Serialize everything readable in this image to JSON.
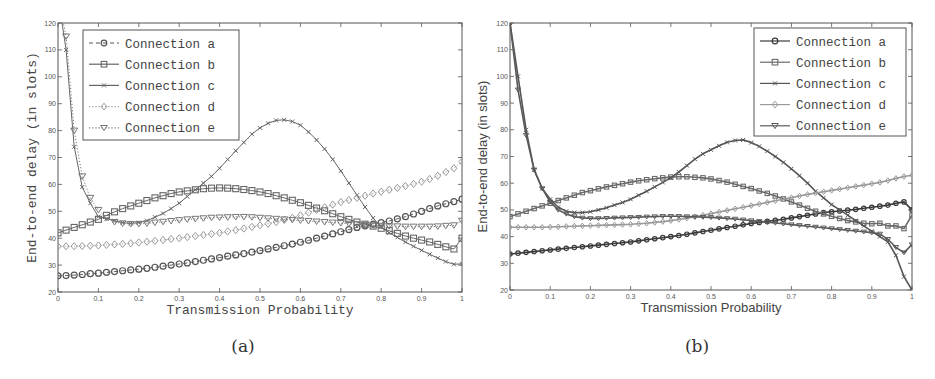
{
  "chart_data": [
    {
      "id": "a",
      "type": "line",
      "caption": "(a)",
      "xlabel": "Transmission Probability",
      "ylabel": "End-to-end delay (in slots)",
      "xlim": [
        0,
        1
      ],
      "ylim": [
        20,
        120
      ],
      "xticks": [
        "0",
        "0.1",
        "0.2",
        "0.3",
        "0.4",
        "0.5",
        "0.6",
        "0.7",
        "0.8",
        "0.9",
        "1"
      ],
      "yticks": [
        "20",
        "30",
        "40",
        "50",
        "60",
        "70",
        "80",
        "90",
        "100",
        "110",
        "120"
      ],
      "grid": false,
      "legend_position": "top-left",
      "x": [
        0,
        0.02,
        0.04,
        0.06,
        0.08,
        0.1,
        0.12,
        0.14,
        0.16,
        0.18,
        0.2,
        0.22,
        0.24,
        0.26,
        0.28,
        0.3,
        0.32,
        0.34,
        0.36,
        0.38,
        0.4,
        0.42,
        0.44,
        0.46,
        0.48,
        0.5,
        0.52,
        0.54,
        0.56,
        0.58,
        0.6,
        0.62,
        0.64,
        0.66,
        0.68,
        0.7,
        0.72,
        0.74,
        0.76,
        0.78,
        0.8,
        0.82,
        0.84,
        0.86,
        0.88,
        0.9,
        0.92,
        0.94,
        0.96,
        0.98,
        1.0
      ],
      "series": [
        {
          "name": "Connection a",
          "marker": "circle",
          "line": "dashed",
          "color": "#555555",
          "values": [
            26,
            26.1,
            26.3,
            26.5,
            26.8,
            27,
            27.3,
            27.6,
            27.9,
            28.2,
            28.5,
            28.8,
            29.2,
            29.6,
            30,
            30.4,
            30.8,
            31.3,
            31.8,
            32.3,
            32.8,
            33.3,
            33.8,
            34.3,
            34.8,
            35.4,
            36,
            36.6,
            37.2,
            37.8,
            38.5,
            39.2,
            40,
            40.8,
            41.6,
            42.4,
            43.2,
            44,
            44.6,
            45.2,
            45.8,
            46.4,
            47.2,
            48,
            49,
            50,
            51,
            52,
            52.8,
            53.6,
            54.5
          ]
        },
        {
          "name": "Connection b",
          "marker": "square",
          "line": "solid",
          "color": "#666666",
          "values": [
            42,
            43,
            44,
            45,
            46,
            47,
            48.5,
            49.8,
            51,
            52,
            53,
            54,
            55,
            55.8,
            56.6,
            57.2,
            57.6,
            58,
            58.4,
            58.6,
            58.7,
            58.6,
            58.4,
            58.1,
            57.7,
            57.2,
            56.6,
            55.8,
            55,
            54.1,
            53.2,
            52.2,
            51.2,
            50.2,
            49.1,
            48,
            47,
            46,
            45.2,
            44.5,
            43.7,
            42.8,
            41.8,
            40.8,
            40,
            39.3,
            38.6,
            37.7,
            36.8,
            36,
            40
          ]
        },
        {
          "name": "Connection c",
          "marker": "x",
          "line": "solid",
          "color": "#666666",
          "values": [
            130,
            110,
            74,
            59,
            53,
            48,
            47.2,
            46.5,
            45.8,
            45.5,
            45.8,
            46.5,
            47.8,
            49.2,
            51,
            53,
            55.5,
            58,
            60.5,
            63,
            66,
            69.3,
            72.5,
            75.6,
            78.7,
            81,
            82.7,
            83.8,
            84,
            83.4,
            82,
            79.5,
            76.5,
            73.2,
            69.3,
            65,
            60.5,
            56,
            51.6,
            47.5,
            44.2,
            42,
            40.3,
            38.6,
            37,
            35.5,
            34,
            32.6,
            31.3,
            30.3,
            30.5
          ]
        },
        {
          "name": "Connection d",
          "marker": "diamond",
          "line": "dotted",
          "color": "#999999",
          "values": [
            37,
            37,
            37,
            37.1,
            37.2,
            37.3,
            37.5,
            37.7,
            37.9,
            38.1,
            38.4,
            38.7,
            39,
            39.3,
            39.7,
            40,
            40.4,
            40.8,
            41.2,
            41.6,
            42,
            42.5,
            43,
            43.6,
            44.2,
            44.8,
            45.4,
            46,
            46.8,
            47.6,
            48.5,
            49.5,
            50.5,
            51.5,
            52.5,
            53.4,
            54.2,
            55,
            55.8,
            56.6,
            57.3,
            58,
            58.7,
            59.4,
            60.2,
            61,
            62,
            63.2,
            64.6,
            66,
            68.5
          ]
        },
        {
          "name": "Connection e",
          "marker": "triangle-down",
          "line": "dotted",
          "color": "#777777",
          "values": [
            130,
            115,
            80,
            63,
            55,
            50.5,
            47.5,
            46,
            45.5,
            45.3,
            45.3,
            45.5,
            45.8,
            46.1,
            46.4,
            46.7,
            47,
            47.2,
            47.4,
            47.6,
            47.7,
            47.8,
            47.9,
            47.9,
            47.8,
            47.6,
            47.4,
            47.2,
            47,
            46.8,
            46.6,
            46.4,
            46.2,
            46,
            45.8,
            45.6,
            45.4,
            45.2,
            45,
            44.8,
            44.6,
            44.5,
            44.4,
            44.3,
            44.3,
            44.3,
            44.3,
            44.4,
            44.6,
            44.8,
            46.5
          ]
        }
      ]
    },
    {
      "id": "b",
      "type": "line",
      "caption": "(b)",
      "xlabel": "Transmission Probability",
      "ylabel": "End-to-end delay (in slots)",
      "xlim": [
        0,
        1
      ],
      "ylim": [
        20,
        120
      ],
      "xticks": [
        "0",
        "0.1",
        "0.2",
        "0.3",
        "0.4",
        "0.5",
        "0.6",
        "0.7",
        "0.8",
        "0.9",
        "1"
      ],
      "yticks": [
        "20",
        "30",
        "40",
        "50",
        "60",
        "70",
        "80",
        "90",
        "100",
        "110",
        "120"
      ],
      "grid": false,
      "legend_position": "top-right",
      "x": [
        0,
        0.02,
        0.04,
        0.06,
        0.08,
        0.1,
        0.12,
        0.14,
        0.16,
        0.18,
        0.2,
        0.22,
        0.24,
        0.26,
        0.28,
        0.3,
        0.32,
        0.34,
        0.36,
        0.38,
        0.4,
        0.42,
        0.44,
        0.46,
        0.48,
        0.5,
        0.52,
        0.54,
        0.56,
        0.58,
        0.6,
        0.62,
        0.64,
        0.66,
        0.68,
        0.7,
        0.72,
        0.74,
        0.76,
        0.78,
        0.8,
        0.82,
        0.84,
        0.86,
        0.88,
        0.9,
        0.92,
        0.94,
        0.96,
        0.98,
        1.0
      ],
      "series": [
        {
          "name": "Connection a",
          "marker": "circle",
          "line": "solid",
          "color": "#3a3a3a",
          "values": [
            33.5,
            33.8,
            34.1,
            34.4,
            34.7,
            35,
            35.3,
            35.6,
            35.9,
            36.2,
            36.5,
            36.8,
            37.1,
            37.4,
            37.7,
            38,
            38.4,
            38.8,
            39.2,
            39.6,
            40,
            40.4,
            40.9,
            41.4,
            41.9,
            42.4,
            42.9,
            43.4,
            43.9,
            44.4,
            44.9,
            45.3,
            45.7,
            46.1,
            46.5,
            47,
            47.5,
            48,
            48.5,
            49,
            49.3,
            49.6,
            49.9,
            50.2,
            50.6,
            51,
            51.4,
            51.8,
            52.5,
            53,
            50
          ]
        },
        {
          "name": "Connection b",
          "marker": "square",
          "line": "solid",
          "color": "#6a6a6a",
          "values": [
            47.5,
            48.5,
            49.5,
            50.5,
            51.5,
            52.5,
            53.5,
            54.5,
            55.5,
            56.5,
            57.2,
            57.9,
            58.6,
            59.2,
            59.8,
            60.4,
            60.9,
            61.3,
            61.7,
            62,
            62.3,
            62.4,
            62.4,
            62.2,
            62,
            61.6,
            61,
            60.4,
            59.6,
            58.8,
            58,
            57.1,
            56.2,
            55.2,
            54.1,
            53,
            51.8,
            50.6,
            49.5,
            48.5,
            47.6,
            46.8,
            46,
            45.5,
            45,
            44.8,
            45,
            44,
            44,
            43,
            48
          ]
        },
        {
          "name": "Connection c",
          "marker": "x",
          "line": "solid",
          "color": "#555555",
          "values": [
            120,
            100,
            80,
            65,
            58,
            54,
            51,
            49.5,
            49,
            49,
            49.3,
            50,
            50.8,
            51.8,
            52.8,
            54,
            55.5,
            57,
            58.6,
            60.3,
            62,
            64.2,
            66.6,
            69,
            71,
            72.5,
            74,
            75.3,
            76,
            76.2,
            75.2,
            73.8,
            72,
            70,
            67.8,
            65.4,
            62.8,
            60,
            57,
            54.5,
            52,
            50,
            48,
            46,
            44,
            42,
            40,
            38,
            33,
            25,
            20
          ]
        },
        {
          "name": "Connection d",
          "marker": "diamond",
          "line": "solid",
          "color": "#9a9a9a",
          "values": [
            43.5,
            43.5,
            43.5,
            43.5,
            43.5,
            43.6,
            43.7,
            43.8,
            43.9,
            44,
            44.1,
            44.2,
            44.3,
            44.4,
            44.5,
            44.6,
            44.8,
            45,
            45.3,
            45.6,
            46,
            46.4,
            46.9,
            47.4,
            48,
            48.6,
            49.2,
            49.8,
            50.4,
            51,
            51.6,
            52.2,
            52.8,
            53.4,
            54,
            54.6,
            55.2,
            55.8,
            56.3,
            56.8,
            57.3,
            57.8,
            58.3,
            58.8,
            59.3,
            59.8,
            60.3,
            61,
            61.8,
            62.5,
            63
          ]
        },
        {
          "name": "Connection e",
          "marker": "triangle-down",
          "line": "solid",
          "color": "#5a5a5a",
          "values": [
            120,
            95,
            78,
            65,
            58,
            53,
            50,
            48.5,
            47.5,
            47,
            46.8,
            46.8,
            46.9,
            47,
            47.1,
            47.2,
            47.3,
            47.4,
            47.5,
            47.6,
            47.6,
            47.6,
            47.5,
            47.4,
            47.3,
            47.2,
            47,
            46.8,
            46.6,
            46.3,
            46,
            45.7,
            45.4,
            45.1,
            44.8,
            44.5,
            44.2,
            43.9,
            43.6,
            43.3,
            43,
            42.7,
            42.4,
            42.1,
            41.8,
            41.5,
            41,
            39,
            36,
            34,
            37
          ]
        }
      ]
    }
  ]
}
